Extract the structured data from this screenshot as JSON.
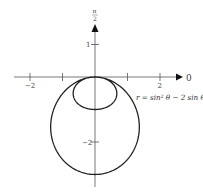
{
  "chart_data": {
    "type": "line",
    "subtype": "polar",
    "title": "",
    "equation_label": "r = sin² θ − 2 sin θ",
    "function": "r = sin^2(theta) - 2*sin(theta)",
    "theta_range": [
      0,
      6.283185
    ],
    "axis_labels": {
      "polar_axis": "0",
      "vertical_axis": "π/2"
    },
    "x_ticks": [
      {
        "value": -2,
        "label": "−2"
      },
      {
        "value": -1,
        "label": ""
      },
      {
        "value": 1,
        "label": ""
      },
      {
        "value": 2,
        "label": "2"
      }
    ],
    "y_ticks": [
      {
        "value": 1,
        "label": "1"
      },
      {
        "value": -2,
        "label": "−2"
      }
    ],
    "xlim": [
      -2.4,
      2.7
    ],
    "ylim": [
      -3.3,
      1.6
    ],
    "grid": false,
    "legend": "none",
    "key_points": [
      {
        "theta": "π/2",
        "r": -1,
        "x": 0,
        "y": -1
      },
      {
        "theta": "3π/2",
        "r": 3,
        "x": 0,
        "y": -3
      },
      {
        "theta": "0",
        "r": 0,
        "x": 0,
        "y": 0
      }
    ]
  },
  "pi_num": "π",
  "pi_den": "2"
}
